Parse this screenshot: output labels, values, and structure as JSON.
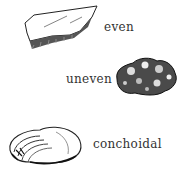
{
  "diagram": {
    "topic": "mineral fracture types",
    "items": [
      {
        "label": "even",
        "icon": "flat-stone-icon"
      },
      {
        "label": "uneven",
        "icon": "rough-rock-icon"
      },
      {
        "label": "conchoidal",
        "icon": "shell-fracture-icon"
      }
    ]
  }
}
